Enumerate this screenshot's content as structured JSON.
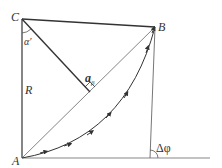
{
  "diagram": {
    "type": "geometry",
    "points": {
      "A": {
        "label": "A",
        "x": 22,
        "y": 158
      },
      "B": {
        "label": "B",
        "x": 155,
        "y": 27
      },
      "C": {
        "label": "C",
        "x": 22,
        "y": 19
      }
    },
    "labels": {
      "C": "C",
      "B": "B",
      "A": "A",
      "R": "R",
      "alpha": "α′",
      "a_beta_main": "a",
      "a_beta_sub": "β",
      "delta_phi": "Δφ"
    },
    "colors": {
      "stroke": "#333333",
      "thin_stroke": "#555555",
      "label": "#333333"
    }
  }
}
